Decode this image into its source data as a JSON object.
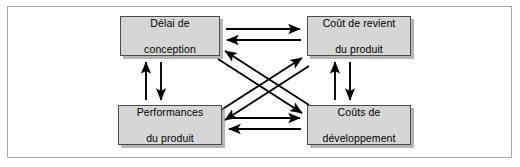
{
  "figure": {
    "frame": true,
    "background": "#ffffff",
    "node_fill": "#d6d6d6",
    "node_border": "#4a4a4a",
    "arrow_color": "#000000"
  },
  "nodes": [
    {
      "id": "delai",
      "line1": "Délai de",
      "line2": "conception"
    },
    {
      "id": "cout",
      "line1": "Coût de revient",
      "line2": "du produit"
    },
    {
      "id": "perf",
      "line1": "Performances",
      "line2": "du produit"
    },
    {
      "id": "dev",
      "line1": "Coûts de",
      "line2": "développement"
    }
  ],
  "connections": [
    {
      "id": "top",
      "from": "delai",
      "to": "cout",
      "orientation": "horizontal",
      "bidirectional": true
    },
    {
      "id": "bottom",
      "from": "perf",
      "to": "dev",
      "orientation": "horizontal",
      "bidirectional": true
    },
    {
      "id": "left",
      "from": "delai",
      "to": "perf",
      "orientation": "vertical",
      "bidirectional": true
    },
    {
      "id": "right",
      "from": "cout",
      "to": "dev",
      "orientation": "vertical",
      "bidirectional": true
    },
    {
      "id": "diagonal-a",
      "from": "delai",
      "to": "dev",
      "orientation": "diagonal",
      "bidirectional": true
    },
    {
      "id": "diagonal-b",
      "from": "perf",
      "to": "cout",
      "orientation": "diagonal",
      "bidirectional": true
    }
  ]
}
